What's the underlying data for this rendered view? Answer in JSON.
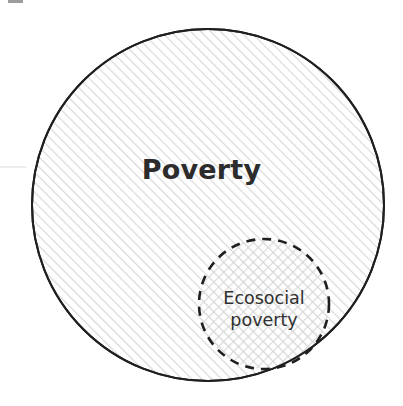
{
  "figure": {
    "type": "venn-diagram",
    "background_color": "#ffffff",
    "width": 403,
    "height": 406
  },
  "sets": {
    "outer": {
      "label": "Poverty",
      "shape": "circle",
      "center_x": 208,
      "center_y": 205,
      "radius": 176,
      "stroke_color": "#1f1f1f",
      "stroke_width": 2,
      "stroke_style": "solid",
      "fill_pattern": "diagonal-hatch",
      "fill_color": "#f7f7f7",
      "label_color": "#2c2c2c",
      "label_weight": "bold",
      "label_size": 27
    },
    "inner": {
      "label_line_1": "Ecosocial",
      "label_line_2": "poverty",
      "label": "Ecosocial poverty",
      "shape": "circle",
      "center_x": 264,
      "center_y": 304,
      "radius": 65,
      "stroke_color": "#1f1f1f",
      "stroke_width": 2.6,
      "stroke_style": "dashed",
      "dash_pattern": "9 7",
      "fill_pattern": "cross-hatch",
      "fill_color": "#f2f2f2",
      "label_color": "#303030",
      "label_weight": "normal",
      "label_size": 17.5
    }
  },
  "relation": "ecosocial poverty is a subset of poverty",
  "artifacts": {
    "top_left_mark": "scan-smudge",
    "left_edge_mark": "scan-smudge"
  }
}
